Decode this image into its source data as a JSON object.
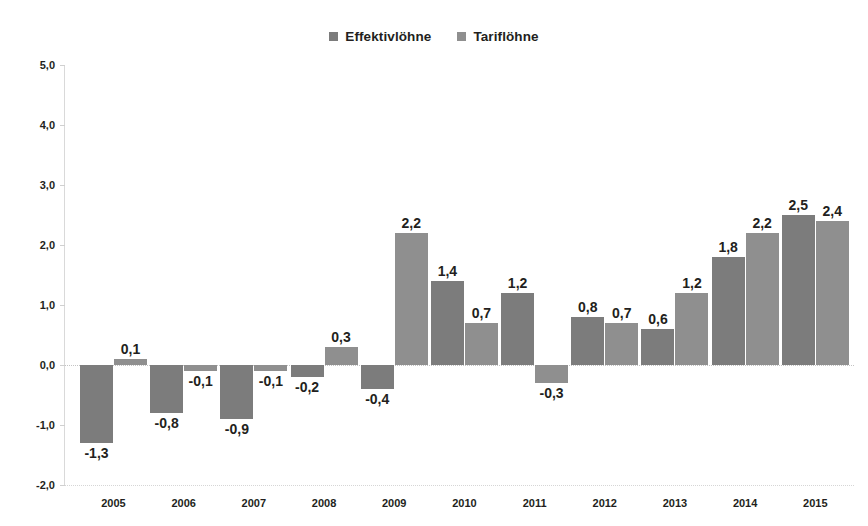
{
  "chart_data": {
    "type": "bar",
    "title": "",
    "subtitle": "",
    "xlabel": "",
    "ylabel": "",
    "ylim": [
      -2.0,
      5.0
    ],
    "ytick_labels": [
      "5,0",
      "4,0",
      "3,0",
      "2,0",
      "1,0",
      "0,0",
      "-1,0",
      "-2,0"
    ],
    "ytick_values": [
      5.0,
      4.0,
      3.0,
      2.0,
      1.0,
      0.0,
      -1.0,
      -2.0
    ],
    "grid": false,
    "legend_position": "top-center",
    "decimal_separator": ",",
    "categories": [
      "2005",
      "2006",
      "2007",
      "2008",
      "2009",
      "2010",
      "2011",
      "2012",
      "2013",
      "2014",
      "2015"
    ],
    "series": [
      {
        "name": "Effektivlöhne",
        "color": "#7c7c7c",
        "values": [
          -1.3,
          -0.8,
          -0.9,
          -0.2,
          -0.4,
          1.4,
          1.2,
          0.8,
          0.6,
          1.8,
          2.5
        ],
        "labels": [
          "-1,3",
          "-0,8",
          "-0,9",
          "-0,2",
          "-0,4",
          "1,4",
          "1,2",
          "0,8",
          "0,6",
          "1,8",
          "2,5"
        ]
      },
      {
        "name": "Tariflöhne",
        "color": "#8f8f8f",
        "values": [
          0.1,
          -0.1,
          -0.1,
          0.3,
          2.2,
          0.7,
          -0.3,
          0.7,
          1.2,
          2.2,
          2.4
        ],
        "labels": [
          "0,1",
          "-0,1",
          "-0,1",
          "0,3",
          "2,2",
          "0,7",
          "-0,3",
          "0,7",
          "1,2",
          "2,2",
          "2,4"
        ]
      }
    ]
  },
  "legend": {
    "items": [
      {
        "label": "Effektivlöhne",
        "swatch_icon": "square-swatch-icon",
        "color": "#7c7c7c"
      },
      {
        "label": "Tariflöhne",
        "swatch_icon": "square-swatch-icon",
        "color": "#8f8f8f"
      }
    ]
  }
}
